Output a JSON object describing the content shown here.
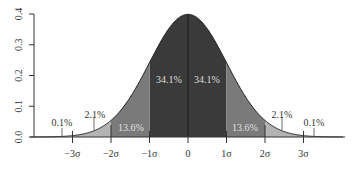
{
  "chart_data": {
    "type": "area",
    "title": "",
    "xlabel": "",
    "ylabel": "",
    "ylim": [
      0.0,
      0.4
    ],
    "xlim": [
      -4,
      4
    ],
    "grid": false,
    "y_ticks": [
      "0.0",
      "0.1",
      "0.2",
      "0.3",
      "0.4"
    ],
    "x_ticks": [
      "−3σ",
      "−2σ",
      "−1σ",
      "0",
      "1σ",
      "2σ",
      "3σ"
    ],
    "curve": "standard normal density",
    "regions": [
      {
        "from": -1,
        "to": 0,
        "label": "34.1%",
        "color": "#3a3a3a"
      },
      {
        "from": 0,
        "to": 1,
        "label": "34.1%",
        "color": "#3a3a3a"
      },
      {
        "from": -2,
        "to": -1,
        "label": "13.6%",
        "color": "#7a7a7a"
      },
      {
        "from": 1,
        "to": 2,
        "label": "13.6%",
        "color": "#7a7a7a"
      },
      {
        "from": -3,
        "to": -2,
        "label": "2.1%",
        "color": "#b4b4b4"
      },
      {
        "from": 2,
        "to": 3,
        "label": "2.1%",
        "color": "#b4b4b4"
      },
      {
        "from": -4,
        "to": -3,
        "label": "0.1%",
        "color": "#dcdcdc"
      },
      {
        "from": 3,
        "to": 4,
        "label": "0.1%",
        "color": "#dcdcdc"
      }
    ],
    "outer_labels": [
      {
        "label": "0.1%",
        "at": -3.5
      },
      {
        "label": "2.1%",
        "at": -2.5
      },
      {
        "label": "2.1%",
        "at": 2.5
      },
      {
        "label": "0.1%",
        "at": 3.5
      }
    ]
  },
  "labels": {
    "y": [
      "0.0",
      "0.1",
      "0.2",
      "0.3",
      "0.4"
    ],
    "x": [
      "−3σ",
      "−2σ",
      "−1σ",
      "0",
      "1σ",
      "2σ",
      "3σ"
    ],
    "inner_left": "34.1%",
    "inner_right": "34.1%",
    "mid_left": "13.6%",
    "mid_right": "13.6%",
    "outer_left_2": "2.1%",
    "outer_right_2": "2.1%",
    "outer_left_3": "0.1%",
    "outer_right_3": "0.1%"
  }
}
